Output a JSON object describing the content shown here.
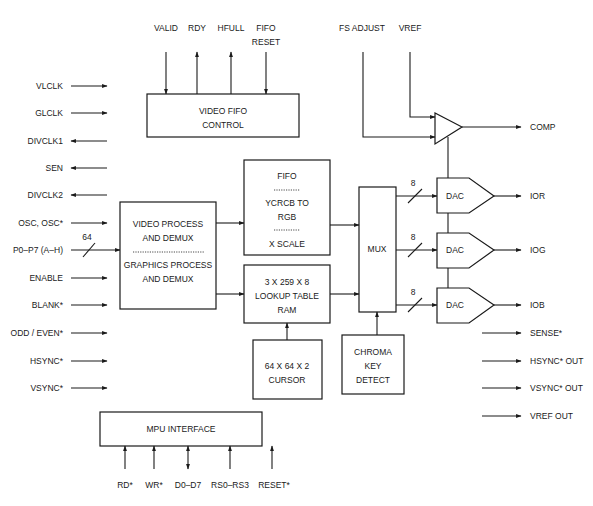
{
  "diagram": {
    "blocks": {
      "video_fifo_control": {
        "line1": "VIDEO  FIFO",
        "line2": "CONTROL"
      },
      "video_process": {
        "line1": "VIDEO  PROCESS",
        "line2": "AND  DEMUX",
        "line3": "GRAPHICS  PROCESS",
        "line4": "AND  DEMUX"
      },
      "fifo": {
        "line1": "FIFO",
        "line2": "YCRCB  TO",
        "line3": "RGB",
        "line4": "X  SCALE"
      },
      "lookup_table": {
        "line1": "3  X  259  X  8",
        "line2": "LOOKUP  TABLE",
        "line3": "RAM"
      },
      "cursor": {
        "line1": "64  X  64  X 2",
        "line2": "CURSOR"
      },
      "mux": {
        "label": "MUX"
      },
      "chroma_key": {
        "line1": "CHROMA",
        "line2": "KEY",
        "line3": "DETECT"
      },
      "dac_r": {
        "label": "DAC"
      },
      "dac_g": {
        "label": "DAC"
      },
      "dac_b": {
        "label": "DAC"
      },
      "mpu_interface": {
        "label": "MPU  INTERFACE"
      }
    },
    "top_signals": {
      "valid": "VALID",
      "rdy": "RDY",
      "hfull": "HFULL",
      "fifo_reset_1": "FIFO",
      "fifo_reset_2": "RESET",
      "fs_adjust": "FS ADJUST",
      "vref": "VREF"
    },
    "left_signals": [
      {
        "label": "VLCLK",
        "direction": "in"
      },
      {
        "label": "GLCLK",
        "direction": "in"
      },
      {
        "label": "DIVCLK1",
        "direction": "out"
      },
      {
        "label": "SEN",
        "direction": "out"
      },
      {
        "label": "DIVCLK2",
        "direction": "out"
      },
      {
        "label": "OSC,  OSC*",
        "direction": "in"
      },
      {
        "label": "P0–P7 (A–H)",
        "direction": "in"
      },
      {
        "label": "ENABLE",
        "direction": "in"
      },
      {
        "label": "BLANK*",
        "direction": "in"
      },
      {
        "label": "ODD / EVEN*",
        "direction": "in"
      },
      {
        "label": "HSYNC*",
        "direction": "in"
      },
      {
        "label": "VSYNC*",
        "direction": "in"
      }
    ],
    "bus_widths": {
      "pixel_bus": "64",
      "dac_r": "8",
      "dac_g": "8",
      "dac_b": "8"
    },
    "right_signals": [
      {
        "label": "COMP"
      },
      {
        "label": "IOR"
      },
      {
        "label": "IOG"
      },
      {
        "label": "IOB"
      },
      {
        "label": "SENSE*"
      },
      {
        "label": "HSYNC*  OUT"
      },
      {
        "label": "VSYNC*  OUT"
      },
      {
        "label": "VREF  OUT"
      }
    ],
    "bottom_signals": [
      {
        "label": "RD*",
        "direction": "in"
      },
      {
        "label": "WR*",
        "direction": "in"
      },
      {
        "label": "D0–D7",
        "direction": "bidirectional"
      },
      {
        "label": "RS0–RS3",
        "direction": "in"
      },
      {
        "label": "RESET*",
        "direction": "in"
      }
    ]
  }
}
